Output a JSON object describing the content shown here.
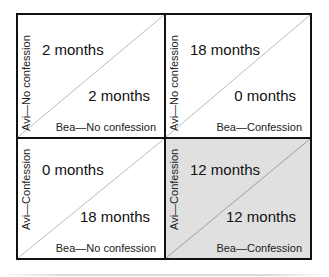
{
  "diagram": {
    "type": "payoff-matrix",
    "players": [
      "Avi",
      "Bea"
    ],
    "colors": {
      "border": "#111111",
      "diagonal": "#a0a0a0",
      "shaded_cell": "#e0e0e0",
      "background": "#ffffff"
    },
    "cells": [
      {
        "position": "top-left",
        "avi_label": "Avi—No confession",
        "bea_label": "Bea—No confession",
        "avi_payoff": "2 months",
        "bea_payoff": "2 months",
        "shaded": false
      },
      {
        "position": "top-right",
        "avi_label": "Avi—No confession",
        "bea_label": "Bea—Confession",
        "avi_payoff": "18 months",
        "bea_payoff": "0 months",
        "shaded": false
      },
      {
        "position": "bottom-left",
        "avi_label": "Avi—Confession",
        "bea_label": "Bea—No confession",
        "avi_payoff": "0 months",
        "bea_payoff": "18 months",
        "shaded": false
      },
      {
        "position": "bottom-right",
        "avi_label": "Avi—Confession",
        "bea_label": "Bea—Confession",
        "avi_payoff": "12 months",
        "bea_payoff": "12 months",
        "shaded": true
      }
    ]
  }
}
